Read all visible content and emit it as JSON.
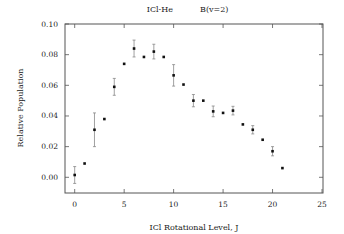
{
  "chart_data": {
    "type": "scatter",
    "title": "ICl-He     B(v=2)",
    "title_parts": [
      "ICl-He",
      "B(v=2)"
    ],
    "xlabel": "ICl Rotational Level, J",
    "ylabel": "Relative Population",
    "xlim": [
      -1,
      25
    ],
    "ylim": [
      -0.01,
      0.1
    ],
    "xticks": [
      0,
      5,
      10,
      15,
      20,
      25
    ],
    "xtick_labels": [
      "0",
      "5",
      "10",
      "15",
      "20",
      "25"
    ],
    "yticks": [
      0.0,
      0.02,
      0.04,
      0.06,
      0.08,
      0.1
    ],
    "ytick_labels": [
      "0.00",
      "0.02",
      "0.04",
      "0.06",
      "0.08",
      "0.10"
    ],
    "grid": false,
    "legend": null,
    "series": [
      {
        "name": "ICl-He B(v=2)",
        "marker": "square",
        "x": [
          0,
          1,
          2,
          3,
          4,
          5,
          6,
          7,
          8,
          9,
          10,
          11,
          12,
          13,
          14,
          15,
          16,
          17,
          18,
          19,
          20,
          21
        ],
        "y": [
          0.0015,
          0.009,
          0.031,
          0.038,
          0.059,
          0.074,
          0.084,
          0.0785,
          0.082,
          0.0785,
          0.0665,
          0.0605,
          0.05,
          0.05,
          0.043,
          0.042,
          0.0435,
          0.0345,
          0.031,
          0.0245,
          0.017,
          0.006
        ],
        "yerr": [
          0.0055,
          null,
          0.011,
          null,
          0.0055,
          null,
          0.0055,
          null,
          0.0048,
          null,
          0.007,
          null,
          0.004,
          null,
          0.0035,
          null,
          0.0028,
          null,
          0.0027,
          null,
          0.003,
          null
        ]
      }
    ]
  }
}
